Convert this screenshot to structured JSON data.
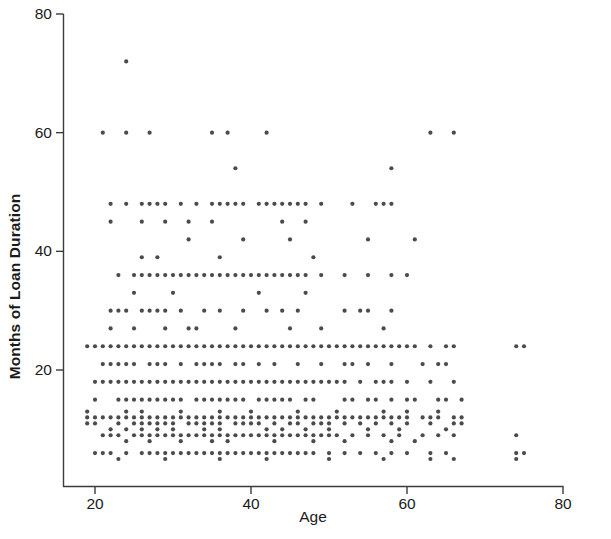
{
  "chart_data": {
    "type": "scatter",
    "title": "",
    "subtitle": "",
    "xlabel": "Age",
    "ylabel": "Months of Loan Duration",
    "xlim": [
      14,
      80
    ],
    "ylim": [
      0,
      80
    ],
    "xticks": [
      20,
      40,
      60,
      80
    ],
    "xtick_labels": [
      "20",
      "40",
      "60",
      "80"
    ],
    "yticks": [
      20,
      40,
      60,
      80
    ],
    "ytick_labels": [
      "20",
      "40",
      "60",
      "80"
    ],
    "grid": false,
    "legend": false,
    "marker": {
      "shape": "circle",
      "size_px": 4.2,
      "color": "#2b2b2b",
      "opacity": 0.85
    },
    "annotations": [
      {
        "text": "single high outlier at age 24, duration 72",
        "x": 24,
        "y": 72
      }
    ],
    "points": [
      [
        24,
        72
      ],
      [
        21,
        60
      ],
      [
        24,
        60
      ],
      [
        27,
        60
      ],
      [
        35,
        60
      ],
      [
        37,
        60
      ],
      [
        42,
        60
      ],
      [
        63,
        60
      ],
      [
        66,
        60
      ],
      [
        38,
        54
      ],
      [
        58,
        54
      ],
      [
        22,
        48
      ],
      [
        24,
        48
      ],
      [
        26,
        48
      ],
      [
        27,
        48
      ],
      [
        28,
        48
      ],
      [
        29,
        48
      ],
      [
        31,
        48
      ],
      [
        33,
        48
      ],
      [
        35,
        48
      ],
      [
        36,
        48
      ],
      [
        37,
        48
      ],
      [
        38,
        48
      ],
      [
        39,
        48
      ],
      [
        41,
        48
      ],
      [
        42,
        48
      ],
      [
        43,
        48
      ],
      [
        44,
        48
      ],
      [
        45,
        48
      ],
      [
        46,
        48
      ],
      [
        47,
        48
      ],
      [
        49,
        48
      ],
      [
        53,
        48
      ],
      [
        56,
        48
      ],
      [
        57,
        48
      ],
      [
        58,
        48
      ],
      [
        22,
        45
      ],
      [
        26,
        45
      ],
      [
        29,
        45
      ],
      [
        32,
        45
      ],
      [
        35,
        45
      ],
      [
        47,
        45
      ],
      [
        32,
        42
      ],
      [
        39,
        42
      ],
      [
        44,
        45
      ],
      [
        45,
        42
      ],
      [
        55,
        42
      ],
      [
        61,
        42
      ],
      [
        26,
        39
      ],
      [
        28,
        39
      ],
      [
        36,
        39
      ],
      [
        48,
        39
      ],
      [
        23,
        36
      ],
      [
        25,
        36
      ],
      [
        26,
        36
      ],
      [
        27,
        36
      ],
      [
        28,
        36
      ],
      [
        29,
        36
      ],
      [
        30,
        36
      ],
      [
        31,
        36
      ],
      [
        32,
        36
      ],
      [
        33,
        36
      ],
      [
        34,
        36
      ],
      [
        35,
        36
      ],
      [
        36,
        36
      ],
      [
        37,
        36
      ],
      [
        38,
        36
      ],
      [
        39,
        36
      ],
      [
        40,
        36
      ],
      [
        41,
        36
      ],
      [
        42,
        36
      ],
      [
        43,
        36
      ],
      [
        44,
        36
      ],
      [
        45,
        36
      ],
      [
        46,
        36
      ],
      [
        47,
        36
      ],
      [
        49,
        36
      ],
      [
        52,
        36
      ],
      [
        55,
        36
      ],
      [
        58,
        36
      ],
      [
        60,
        36
      ],
      [
        25,
        33
      ],
      [
        30,
        33
      ],
      [
        41,
        33
      ],
      [
        47,
        33
      ],
      [
        22,
        30
      ],
      [
        23,
        30
      ],
      [
        24,
        30
      ],
      [
        26,
        30
      ],
      [
        27,
        30
      ],
      [
        28,
        30
      ],
      [
        29,
        30
      ],
      [
        31,
        30
      ],
      [
        34,
        30
      ],
      [
        36,
        30
      ],
      [
        39,
        30
      ],
      [
        42,
        30
      ],
      [
        44,
        30
      ],
      [
        46,
        30
      ],
      [
        52,
        30
      ],
      [
        54,
        30
      ],
      [
        55,
        30
      ],
      [
        58,
        30
      ],
      [
        22,
        27
      ],
      [
        25,
        27
      ],
      [
        29,
        27
      ],
      [
        32,
        27
      ],
      [
        33,
        27
      ],
      [
        38,
        27
      ],
      [
        45,
        27
      ],
      [
        49,
        27
      ],
      [
        57,
        27
      ],
      [
        19,
        24
      ],
      [
        20,
        24
      ],
      [
        21,
        24
      ],
      [
        22,
        24
      ],
      [
        23,
        24
      ],
      [
        24,
        24
      ],
      [
        25,
        24
      ],
      [
        26,
        24
      ],
      [
        27,
        24
      ],
      [
        28,
        24
      ],
      [
        29,
        24
      ],
      [
        30,
        24
      ],
      [
        31,
        24
      ],
      [
        32,
        24
      ],
      [
        33,
        24
      ],
      [
        34,
        24
      ],
      [
        35,
        24
      ],
      [
        36,
        24
      ],
      [
        37,
        24
      ],
      [
        38,
        24
      ],
      [
        39,
        24
      ],
      [
        40,
        24
      ],
      [
        41,
        24
      ],
      [
        42,
        24
      ],
      [
        43,
        24
      ],
      [
        44,
        24
      ],
      [
        45,
        24
      ],
      [
        46,
        24
      ],
      [
        47,
        24
      ],
      [
        48,
        24
      ],
      [
        49,
        24
      ],
      [
        50,
        24
      ],
      [
        51,
        24
      ],
      [
        52,
        24
      ],
      [
        53,
        24
      ],
      [
        54,
        24
      ],
      [
        55,
        24
      ],
      [
        56,
        24
      ],
      [
        57,
        24
      ],
      [
        58,
        24
      ],
      [
        59,
        24
      ],
      [
        60,
        24
      ],
      [
        61,
        24
      ],
      [
        63,
        24
      ],
      [
        65,
        24
      ],
      [
        66,
        24
      ],
      [
        74,
        24
      ],
      [
        75,
        24
      ],
      [
        21,
        21
      ],
      [
        22,
        21
      ],
      [
        23,
        21
      ],
      [
        24,
        21
      ],
      [
        25,
        21
      ],
      [
        27,
        21
      ],
      [
        28,
        21
      ],
      [
        29,
        21
      ],
      [
        31,
        21
      ],
      [
        33,
        21
      ],
      [
        34,
        21
      ],
      [
        35,
        21
      ],
      [
        36,
        21
      ],
      [
        38,
        21
      ],
      [
        39,
        21
      ],
      [
        41,
        21
      ],
      [
        43,
        21
      ],
      [
        46,
        21
      ],
      [
        49,
        21
      ],
      [
        52,
        21
      ],
      [
        53,
        21
      ],
      [
        55,
        21
      ],
      [
        58,
        21
      ],
      [
        62,
        21
      ],
      [
        64,
        21
      ],
      [
        65,
        21
      ],
      [
        20,
        18
      ],
      [
        21,
        18
      ],
      [
        22,
        18
      ],
      [
        23,
        18
      ],
      [
        24,
        18
      ],
      [
        25,
        18
      ],
      [
        26,
        18
      ],
      [
        27,
        18
      ],
      [
        28,
        18
      ],
      [
        29,
        18
      ],
      [
        30,
        18
      ],
      [
        31,
        18
      ],
      [
        32,
        18
      ],
      [
        33,
        18
      ],
      [
        34,
        18
      ],
      [
        35,
        18
      ],
      [
        36,
        18
      ],
      [
        37,
        18
      ],
      [
        38,
        18
      ],
      [
        39,
        18
      ],
      [
        40,
        18
      ],
      [
        41,
        18
      ],
      [
        42,
        18
      ],
      [
        43,
        18
      ],
      [
        44,
        18
      ],
      [
        45,
        18
      ],
      [
        46,
        18
      ],
      [
        47,
        18
      ],
      [
        48,
        18
      ],
      [
        49,
        18
      ],
      [
        50,
        18
      ],
      [
        51,
        18
      ],
      [
        52,
        18
      ],
      [
        54,
        18
      ],
      [
        56,
        18
      ],
      [
        57,
        18
      ],
      [
        58,
        18
      ],
      [
        60,
        18
      ],
      [
        63,
        18
      ],
      [
        66,
        18
      ],
      [
        20,
        15
      ],
      [
        23,
        15
      ],
      [
        24,
        15
      ],
      [
        25,
        15
      ],
      [
        26,
        15
      ],
      [
        27,
        15
      ],
      [
        28,
        15
      ],
      [
        29,
        15
      ],
      [
        30,
        15
      ],
      [
        31,
        15
      ],
      [
        33,
        15
      ],
      [
        34,
        15
      ],
      [
        35,
        15
      ],
      [
        36,
        15
      ],
      [
        37,
        15
      ],
      [
        38,
        15
      ],
      [
        39,
        15
      ],
      [
        41,
        15
      ],
      [
        42,
        15
      ],
      [
        43,
        15
      ],
      [
        44,
        15
      ],
      [
        45,
        15
      ],
      [
        47,
        15
      ],
      [
        48,
        15
      ],
      [
        52,
        15
      ],
      [
        53,
        15
      ],
      [
        55,
        15
      ],
      [
        56,
        15
      ],
      [
        58,
        15
      ],
      [
        60,
        15
      ],
      [
        61,
        15
      ],
      [
        64,
        15
      ],
      [
        65,
        15
      ],
      [
        67,
        15
      ],
      [
        19,
        13
      ],
      [
        24,
        13
      ],
      [
        26,
        13
      ],
      [
        31,
        13
      ],
      [
        36,
        13
      ],
      [
        40,
        13
      ],
      [
        46,
        13
      ],
      [
        51,
        13
      ],
      [
        57,
        13
      ],
      [
        60,
        13
      ],
      [
        64,
        13
      ],
      [
        19,
        12
      ],
      [
        20,
        12
      ],
      [
        21,
        12
      ],
      [
        22,
        12
      ],
      [
        23,
        12
      ],
      [
        24,
        12
      ],
      [
        25,
        12
      ],
      [
        26,
        12
      ],
      [
        27,
        12
      ],
      [
        28,
        12
      ],
      [
        29,
        12
      ],
      [
        30,
        12
      ],
      [
        31,
        12
      ],
      [
        32,
        12
      ],
      [
        33,
        12
      ],
      [
        34,
        12
      ],
      [
        35,
        12
      ],
      [
        36,
        12
      ],
      [
        37,
        12
      ],
      [
        38,
        12
      ],
      [
        39,
        12
      ],
      [
        40,
        12
      ],
      [
        41,
        12
      ],
      [
        42,
        12
      ],
      [
        43,
        12
      ],
      [
        44,
        12
      ],
      [
        45,
        12
      ],
      [
        46,
        12
      ],
      [
        47,
        12
      ],
      [
        48,
        12
      ],
      [
        49,
        12
      ],
      [
        50,
        12
      ],
      [
        51,
        12
      ],
      [
        52,
        12
      ],
      [
        53,
        12
      ],
      [
        54,
        12
      ],
      [
        55,
        12
      ],
      [
        56,
        12
      ],
      [
        57,
        12
      ],
      [
        58,
        12
      ],
      [
        59,
        12
      ],
      [
        60,
        12
      ],
      [
        62,
        12
      ],
      [
        63,
        12
      ],
      [
        64,
        12
      ],
      [
        66,
        12
      ],
      [
        67,
        12
      ],
      [
        19,
        11
      ],
      [
        20,
        11
      ],
      [
        23,
        11
      ],
      [
        25,
        11
      ],
      [
        26,
        11
      ],
      [
        27,
        11
      ],
      [
        28,
        11
      ],
      [
        29,
        11
      ],
      [
        30,
        11
      ],
      [
        32,
        11
      ],
      [
        33,
        11
      ],
      [
        34,
        11
      ],
      [
        35,
        11
      ],
      [
        36,
        11
      ],
      [
        38,
        11
      ],
      [
        39,
        11
      ],
      [
        40,
        11
      ],
      [
        41,
        11
      ],
      [
        43,
        11
      ],
      [
        45,
        11
      ],
      [
        46,
        11
      ],
      [
        48,
        11
      ],
      [
        49,
        11
      ],
      [
        50,
        11
      ],
      [
        52,
        11
      ],
      [
        54,
        11
      ],
      [
        56,
        11
      ],
      [
        58,
        11
      ],
      [
        60,
        11
      ],
      [
        63,
        11
      ],
      [
        66,
        11
      ],
      [
        67,
        11
      ],
      [
        22,
        10
      ],
      [
        24,
        10
      ],
      [
        26,
        10
      ],
      [
        28,
        10
      ],
      [
        30,
        10
      ],
      [
        34,
        10
      ],
      [
        36,
        10
      ],
      [
        42,
        10
      ],
      [
        44,
        10
      ],
      [
        47,
        10
      ],
      [
        50,
        10
      ],
      [
        55,
        10
      ],
      [
        59,
        10
      ],
      [
        65,
        10
      ],
      [
        21,
        9
      ],
      [
        22,
        9
      ],
      [
        23,
        9
      ],
      [
        25,
        9
      ],
      [
        26,
        9
      ],
      [
        27,
        9
      ],
      [
        28,
        9
      ],
      [
        29,
        9
      ],
      [
        30,
        9
      ],
      [
        31,
        9
      ],
      [
        32,
        9
      ],
      [
        33,
        9
      ],
      [
        34,
        9
      ],
      [
        35,
        9
      ],
      [
        36,
        9
      ],
      [
        37,
        9
      ],
      [
        38,
        9
      ],
      [
        39,
        9
      ],
      [
        40,
        9
      ],
      [
        41,
        9
      ],
      [
        42,
        9
      ],
      [
        43,
        9
      ],
      [
        44,
        9
      ],
      [
        45,
        9
      ],
      [
        46,
        9
      ],
      [
        47,
        9
      ],
      [
        48,
        9
      ],
      [
        49,
        9
      ],
      [
        50,
        9
      ],
      [
        51,
        9
      ],
      [
        53,
        9
      ],
      [
        55,
        9
      ],
      [
        57,
        9
      ],
      [
        59,
        9
      ],
      [
        62,
        9
      ],
      [
        64,
        9
      ],
      [
        66,
        9
      ],
      [
        74,
        9
      ],
      [
        24,
        8
      ],
      [
        27,
        8
      ],
      [
        31,
        8
      ],
      [
        35,
        8
      ],
      [
        37,
        8
      ],
      [
        43,
        8
      ],
      [
        48,
        8
      ],
      [
        52,
        8
      ],
      [
        58,
        8
      ],
      [
        61,
        8
      ],
      [
        20,
        6
      ],
      [
        21,
        6
      ],
      [
        22,
        6
      ],
      [
        24,
        6
      ],
      [
        26,
        6
      ],
      [
        27,
        6
      ],
      [
        28,
        6
      ],
      [
        29,
        6
      ],
      [
        30,
        6
      ],
      [
        31,
        6
      ],
      [
        32,
        6
      ],
      [
        33,
        6
      ],
      [
        34,
        6
      ],
      [
        35,
        6
      ],
      [
        36,
        6
      ],
      [
        37,
        6
      ],
      [
        38,
        6
      ],
      [
        39,
        6
      ],
      [
        40,
        6
      ],
      [
        41,
        6
      ],
      [
        42,
        6
      ],
      [
        43,
        6
      ],
      [
        44,
        6
      ],
      [
        45,
        6
      ],
      [
        46,
        6
      ],
      [
        47,
        6
      ],
      [
        48,
        6
      ],
      [
        50,
        6
      ],
      [
        52,
        6
      ],
      [
        54,
        6
      ],
      [
        56,
        6
      ],
      [
        58,
        6
      ],
      [
        60,
        6
      ],
      [
        63,
        6
      ],
      [
        65,
        6
      ],
      [
        74,
        6
      ],
      [
        75,
        6
      ],
      [
        23,
        5
      ],
      [
        29,
        5
      ],
      [
        36,
        5
      ],
      [
        42,
        5
      ],
      [
        50,
        5
      ],
      [
        57,
        5
      ],
      [
        74,
        5
      ],
      [
        63,
        5
      ],
      [
        66,
        5
      ]
    ]
  },
  "axes": {
    "y_title": "Months of Loan Duration",
    "x_title": "Age",
    "x_tick_labels": [
      "20",
      "40",
      "60",
      "80"
    ],
    "y_tick_labels": [
      "80",
      "60",
      "40",
      "20"
    ],
    "axis_color": "#3c3c3c",
    "text_color": "#1a1a1a"
  }
}
